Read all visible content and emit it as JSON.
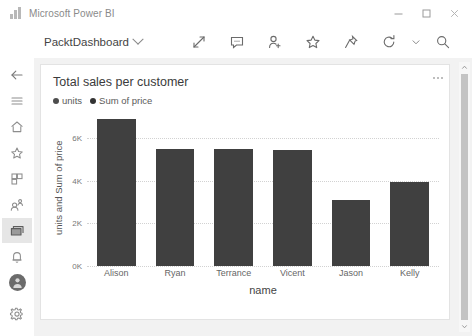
{
  "window": {
    "app_title": "Microsoft Power BI",
    "logo_icon": "powerbi-bars-icon",
    "controls": [
      {
        "name": "minimize-button",
        "icon": "minimize-icon"
      },
      {
        "name": "maximize-button",
        "icon": "maximize-icon"
      },
      {
        "name": "close-button",
        "icon": "close-icon"
      }
    ]
  },
  "commandbar": {
    "dashboard_name": "PacktDashboard",
    "dropdown_icon": "chevron-down-icon",
    "actions": [
      {
        "name": "fullscreen-button",
        "icon": "expand-arrows-icon"
      },
      {
        "name": "comment-button",
        "icon": "comment-bubble-icon"
      },
      {
        "name": "share-button",
        "icon": "add-person-icon"
      },
      {
        "name": "favorite-button",
        "icon": "star-icon"
      },
      {
        "name": "pin-button",
        "icon": "pin-icon"
      },
      {
        "name": "refresh-button",
        "icon": "refresh-icon"
      },
      {
        "name": "refresh-dropdown-button",
        "icon": "chevron-down-icon"
      },
      {
        "name": "search-button",
        "icon": "search-icon"
      }
    ]
  },
  "sidebar": {
    "items": [
      {
        "name": "back-button",
        "icon": "arrow-left-icon",
        "active": false
      },
      {
        "name": "menu-button",
        "icon": "hamburger-icon",
        "active": false
      },
      {
        "name": "home-button",
        "icon": "home-icon",
        "active": false
      },
      {
        "name": "favorites-button",
        "icon": "star-icon",
        "active": false
      },
      {
        "name": "apps-button",
        "icon": "apps-grid-icon",
        "active": false
      },
      {
        "name": "shared-with-me-button",
        "icon": "shared-people-icon",
        "active": false
      },
      {
        "name": "dashboards-button",
        "icon": "dashboard-icon",
        "active": true
      },
      {
        "name": "notifications-button",
        "icon": "bell-icon",
        "active": false
      }
    ],
    "avatar": {
      "name": "avatar",
      "icon": "person-icon"
    },
    "settings": {
      "name": "settings-button",
      "icon": "gear-icon"
    }
  },
  "card": {
    "title": "Total sales per customer",
    "menu_icon": "ellipsis-icon"
  },
  "scrollbar": {
    "up_icon": "chevron-up-icon",
    "down_icon": "chevron-down-icon"
  },
  "colors": {
    "bar": "#404040",
    "legend_units": "#4d4d4d",
    "legend_sum": "#333333",
    "canvas_bg": "#f2f2f2",
    "grid": "#d2d2d2"
  },
  "chart_data": {
    "type": "bar",
    "title": "Total sales per customer",
    "categories": [
      "Alison",
      "Ryan",
      "Terrance",
      "Vicent",
      "Jason",
      "Kelly"
    ],
    "values": [
      6900,
      5500,
      5500,
      5450,
      3100,
      3950
    ],
    "series": [
      {
        "name": "units and Sum of price",
        "values": [
          6900,
          5500,
          5500,
          5450,
          3100,
          3950
        ]
      }
    ],
    "legend": [
      {
        "label": "units",
        "color": "#4d4d4d"
      },
      {
        "label": "Sum of price",
        "color": "#333333"
      }
    ],
    "legend_position": "top-left",
    "xlabel": "name",
    "ylabel": "units and Sum of price",
    "ylim": [
      0,
      7400
    ],
    "yticks": [
      0,
      2000,
      4000,
      6000
    ],
    "ytick_labels": [
      "0K",
      "2K",
      "4K",
      "6K"
    ],
    "grid": true,
    "grid_axis": "y"
  }
}
